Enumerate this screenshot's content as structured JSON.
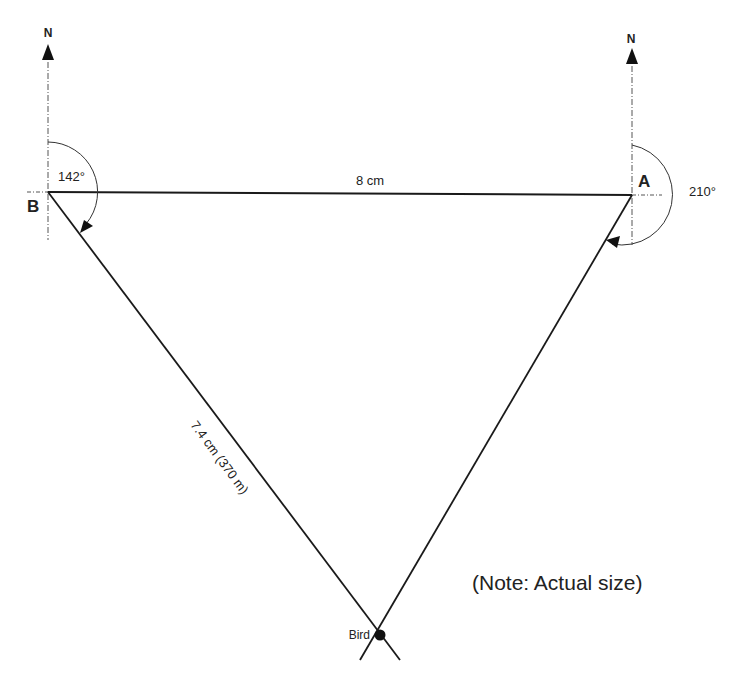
{
  "diagram": {
    "type": "bearing-triangulation",
    "points": {
      "A": {
        "label": "A",
        "north_label": "N",
        "bearing": "210°"
      },
      "B": {
        "label": "B",
        "north_label": "N",
        "bearing": "142°"
      },
      "bird": {
        "label": "Bird"
      }
    },
    "sides": {
      "AB": {
        "label": "8 cm"
      },
      "B_bird": {
        "label": "7.4 cm (370 m)"
      }
    },
    "note": "(Note: Actual size)",
    "colors": {
      "line": "#1a1a1a",
      "construction": "#555555",
      "background": "#ffffff"
    }
  }
}
